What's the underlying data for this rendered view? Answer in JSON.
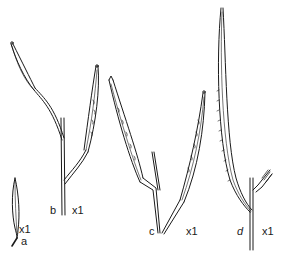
{
  "figure": {
    "background": "#ffffff",
    "ink": "#1a1a1a",
    "specimens": [
      {
        "id": "a",
        "label": "a",
        "scale": "x1"
      },
      {
        "id": "b",
        "label": "b",
        "scale": "x1"
      },
      {
        "id": "c",
        "label": "c",
        "scale": "x1"
      },
      {
        "id": "d",
        "label": "d",
        "scale": "x1"
      }
    ]
  }
}
